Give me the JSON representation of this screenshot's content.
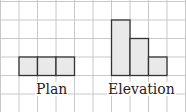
{
  "diagram": {
    "grid": {
      "cell": 18.6,
      "color": "#c8c8c8"
    },
    "fill_color": "#e9e9e9",
    "outline_color": "#333333",
    "plan": {
      "label": "Plan",
      "cells": [
        [
          1,
          3
        ],
        [
          2,
          3
        ],
        [
          3,
          3
        ]
      ]
    },
    "elevation": {
      "label": "Elevation",
      "columns": [
        {
          "col": 6,
          "height": 3
        },
        {
          "col": 7,
          "height": 2
        },
        {
          "col": 8,
          "height": 1
        }
      ],
      "base_row": 4
    }
  }
}
